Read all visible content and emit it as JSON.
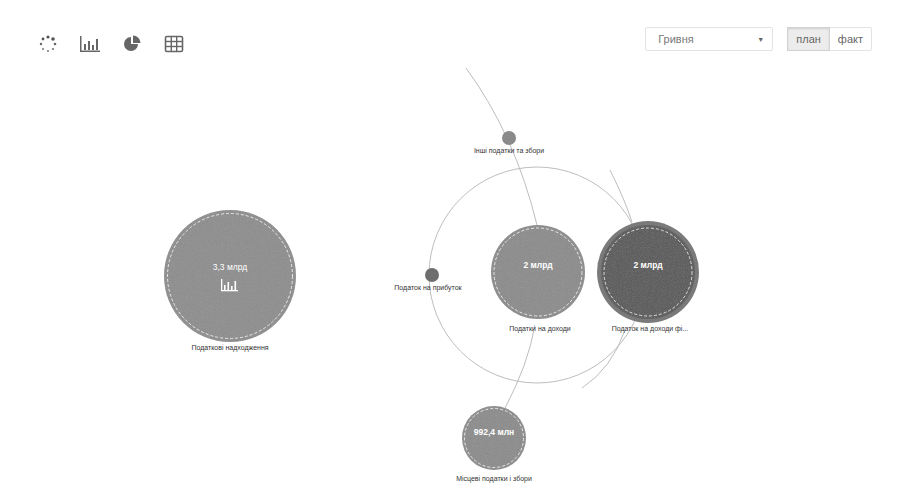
{
  "toolbar": {
    "views": [
      {
        "name": "bubbles-view",
        "icon": "dots-circle-icon"
      },
      {
        "name": "bar-chart-view",
        "icon": "bar-chart-icon"
      },
      {
        "name": "pie-chart-view",
        "icon": "pie-chart-icon"
      },
      {
        "name": "table-view",
        "icon": "table-grid-icon"
      }
    ]
  },
  "controls": {
    "currency": {
      "selected": "Гривня"
    },
    "mode": {
      "options": [
        {
          "label": "план",
          "active": true
        },
        {
          "label": "факт",
          "active": false
        }
      ]
    }
  },
  "colors": {
    "root_bubble": "#8c8c8c",
    "child_bubble": "#8a8a8a",
    "highlight_bubble": "#555555",
    "highlight_ring": "#7a7a7a",
    "small_node": "#6e6e6e",
    "orbit_line": "#b5b5b5"
  },
  "bubbles": {
    "root": {
      "value": "3,3 млрд",
      "label": "Податкові надходження"
    },
    "income_taxes": {
      "value": "2 млрд",
      "label": "Податки на доходи"
    },
    "personal_income_tax": {
      "value": "2 млрд",
      "label": "Податок на доходи фі..."
    },
    "profit_tax": {
      "value": "",
      "label": "Податок на прибуток"
    },
    "other_taxes": {
      "value": "",
      "label": "Інші податки та збори"
    },
    "local_taxes": {
      "value": "992,4 млн",
      "label": "Місцеві податки і збори"
    }
  }
}
